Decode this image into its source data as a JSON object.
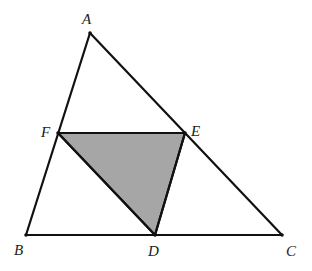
{
  "diagram": {
    "type": "geometry-triangle",
    "points": {
      "A": {
        "label": "A"
      },
      "B": {
        "label": "B"
      },
      "C": {
        "label": "C"
      },
      "D": {
        "label": "D"
      },
      "E": {
        "label": "E"
      },
      "F": {
        "label": "F"
      }
    },
    "segments": [
      "AB",
      "BC",
      "CA",
      "FE",
      "ED",
      "DF"
    ],
    "shaded_region": "DEF",
    "colors": {
      "stroke": "#111111",
      "shade": "#a6a6a6",
      "background": "#ffffff"
    }
  }
}
